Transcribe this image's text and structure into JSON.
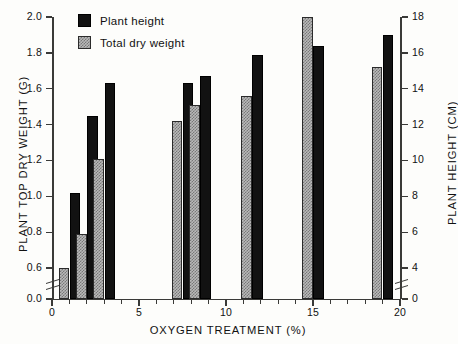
{
  "chart_data": {
    "type": "bar",
    "title": "",
    "xlabel": "OXYGEN TREATMENT (%)",
    "ylabel": "PLANT TOP DRY WEIGHT (G)",
    "ylabel_right": "PLANT HEIGHT (CM)",
    "grid": false,
    "legend_position": "top-left",
    "axis_break": true,
    "x": [
      1,
      2,
      3,
      7.5,
      8.5,
      11.5,
      15,
      19
    ],
    "xlim": [
      0,
      20
    ],
    "ylim_left": [
      0.0,
      2.0
    ],
    "ylim_right": [
      0,
      18
    ],
    "yticks_left": [
      "0.0",
      "0.6",
      "0.8",
      "1.0",
      "1.2",
      "1.4",
      "1.6",
      "1.8",
      "2.0"
    ],
    "yticks_right": [
      "0",
      "4",
      "6",
      "8",
      "10",
      "12",
      "14",
      "16",
      "18"
    ],
    "xticks": [
      "0",
      "5",
      "10",
      "15",
      "20"
    ],
    "series": [
      {
        "name": "Plant height",
        "axis": "right",
        "unit": "cm",
        "color": "#121212",
        "pattern": "solid-black",
        "values": [
          8.4,
          12.2,
          14.1,
          14.1,
          14.5,
          15.7,
          16.5,
          17.1
        ],
        "values_plotted_left_scale": [
          1.02,
          1.45,
          1.63,
          1.63,
          1.67,
          1.79,
          1.84,
          1.9
        ]
      },
      {
        "name": "Total dry weight",
        "axis": "left",
        "unit": "g",
        "color": "#b9b9b9",
        "pattern": "checkered-gray",
        "values": [
          0.6,
          0.79,
          1.21,
          1.42,
          1.51,
          1.56,
          2.0,
          1.72
        ]
      }
    ]
  },
  "legend": {
    "items": [
      {
        "label": "Plant height",
        "swatch": "solid-black"
      },
      {
        "label": "Total dry weight",
        "swatch": "checkered-gray"
      }
    ]
  },
  "axes": {
    "left_title": "PLANT TOP DRY WEIGHT (G)",
    "right_title": "PLANT HEIGHT (CM)",
    "x_title": "OXYGEN TREATMENT (%)"
  }
}
